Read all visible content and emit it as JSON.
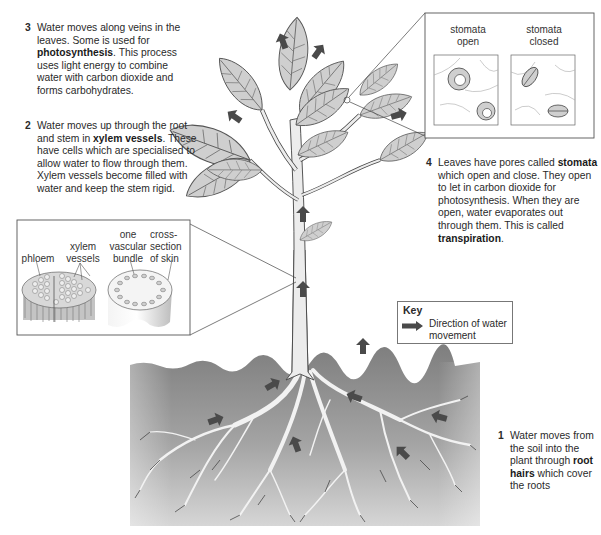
{
  "diagram": {
    "steps": [
      {
        "number": "1",
        "parts": [
          "Water moves from the soil into the plant through ",
          "root hairs",
          " which cover the roots"
        ]
      },
      {
        "number": "2",
        "parts": [
          "Water moves up through the root and stem in ",
          "xylem vessels",
          ". These have cells which are specialised to allow water to flow through them. Xylem vessels become filled with water and keep the stem rigid."
        ]
      },
      {
        "number": "3",
        "parts": [
          "Water moves along veins in the leaves. Some is used for ",
          "photosynthesis",
          ". This process uses light energy to combine water with carbon dioxide and forms carbohydrates."
        ]
      },
      {
        "number": "4",
        "parts": [
          "Leaves have pores called ",
          "stomata",
          " which open and close. They open to let in carbon dioxide for photosynthesis. When they are open, water evaporates out through them. This is called ",
          "transpiration",
          "."
        ]
      }
    ],
    "stomata_inset": {
      "open_label_1": "stomata",
      "open_label_2": "open",
      "closed_label_1": "stomata",
      "closed_label_2": "closed"
    },
    "stem_inset": {
      "phloem": "phloem",
      "xylem_1": "xylem",
      "xylem_2": "vessels",
      "bundle_1": "one",
      "bundle_2": "vascular",
      "bundle_3": "bundle",
      "skin_1": "cross-",
      "skin_2": "section",
      "skin_3": "of skin"
    },
    "key": {
      "title": "Key",
      "arrow_icon": "dark-arrow-icon",
      "description_1": "Direction of water",
      "description_2": "movement"
    },
    "colors": {
      "soil": "#8c8c8c",
      "leaf_fill": "#cfcfcf",
      "stem_fill": "#ececec",
      "arrow": "#4a4a4a",
      "line": "#555555",
      "root": "#f2f2f2"
    }
  }
}
